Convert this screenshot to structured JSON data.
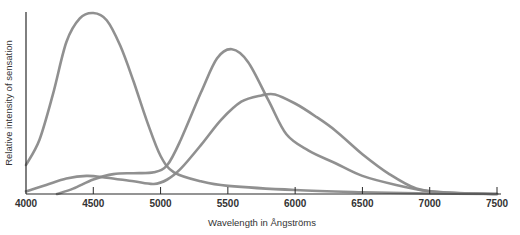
{
  "chart_data": {
    "type": "line",
    "title": "",
    "xlabel": "Wavelength in Ångströms",
    "ylabel": "Relative intensity of sensation",
    "xlim": [
      4000,
      7500
    ],
    "ylim": [
      0,
      100
    ],
    "grid": false,
    "legend": "none",
    "x_ticks": [
      4000,
      4500,
      5000,
      5500,
      6000,
      6500,
      7000,
      7500
    ],
    "x_tick_labels": [
      "4000",
      "4500",
      "5000",
      "5500",
      "6000",
      "6500",
      "7000",
      "7500"
    ],
    "y_ticks": [],
    "series": [
      {
        "name": "short-wavelength (blue) sensation",
        "points": [
          [
            4000,
            16
          ],
          [
            4100,
            30
          ],
          [
            4200,
            55
          ],
          [
            4300,
            84
          ],
          [
            4400,
            97
          ],
          [
            4500,
            100
          ],
          [
            4600,
            96
          ],
          [
            4700,
            82
          ],
          [
            4800,
            62
          ],
          [
            4900,
            40
          ],
          [
            5000,
            21
          ],
          [
            5100,
            12
          ],
          [
            5300,
            7
          ],
          [
            5500,
            4.5
          ],
          [
            6000,
            2.2
          ],
          [
            6500,
            1
          ],
          [
            7000,
            0.3
          ],
          [
            7500,
            0
          ]
        ]
      },
      {
        "name": "middle-wavelength (green) sensation",
        "points": [
          [
            4230,
            0
          ],
          [
            4350,
            3
          ],
          [
            4500,
            8
          ],
          [
            4650,
            11
          ],
          [
            4800,
            11.5
          ],
          [
            4950,
            12
          ],
          [
            5050,
            16
          ],
          [
            5150,
            30
          ],
          [
            5300,
            56
          ],
          [
            5420,
            75
          ],
          [
            5530,
            80
          ],
          [
            5650,
            73
          ],
          [
            5800,
            52
          ],
          [
            5935,
            33
          ],
          [
            6100,
            24
          ],
          [
            6300,
            17
          ],
          [
            6500,
            10
          ],
          [
            6750,
            5
          ],
          [
            7000,
            1.5
          ],
          [
            7250,
            0.4
          ],
          [
            7500,
            0
          ]
        ]
      },
      {
        "name": "long-wavelength (red) sensation",
        "points": [
          [
            4000,
            1.5
          ],
          [
            4150,
            5
          ],
          [
            4300,
            8.5
          ],
          [
            4450,
            10
          ],
          [
            4600,
            9
          ],
          [
            4800,
            7
          ],
          [
            4950,
            5.5
          ],
          [
            5050,
            8
          ],
          [
            5150,
            14
          ],
          [
            5300,
            27
          ],
          [
            5450,
            41
          ],
          [
            5600,
            51
          ],
          [
            5750,
            54.5
          ],
          [
            5850,
            55
          ],
          [
            6000,
            50
          ],
          [
            6150,
            43
          ],
          [
            6300,
            35
          ],
          [
            6500,
            22
          ],
          [
            6700,
            11
          ],
          [
            6900,
            3
          ],
          [
            7100,
            1
          ],
          [
            7500,
            0
          ]
        ]
      }
    ]
  }
}
